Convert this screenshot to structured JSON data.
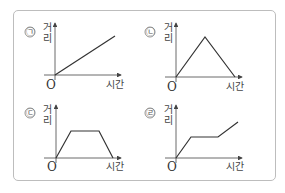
{
  "graphs": [
    {
      "marker": "㉠",
      "y_label_1": "거",
      "y_label_2": "리",
      "origin": "O",
      "x_label": "시간",
      "shape": "linear increasing"
    },
    {
      "marker": "㉡",
      "y_label_1": "거",
      "y_label_2": "리",
      "origin": "O",
      "x_label": "시간",
      "shape": "rise then fall"
    },
    {
      "marker": "㉢",
      "y_label_1": "거",
      "y_label_2": "리",
      "origin": "O",
      "x_label": "시간",
      "shape": "rise, flat, fall"
    },
    {
      "marker": "㉣",
      "y_label_1": "거",
      "y_label_2": "리",
      "origin": "O",
      "x_label": "시간",
      "shape": "rise, flat, rise"
    }
  ]
}
